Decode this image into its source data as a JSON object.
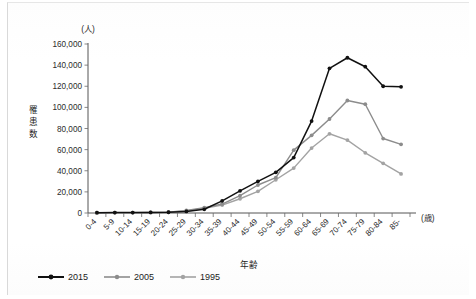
{
  "figure": {
    "y_unit_label": "(人)",
    "x_unit_label": "(歳)",
    "y_axis_title": "罹患数",
    "x_axis_title": "年齢"
  },
  "legend": {
    "items": [
      {
        "label": "2015",
        "color": "#111111"
      },
      {
        "label": "2005",
        "color": "#8c8c8c"
      },
      {
        "label": "1995",
        "color": "#a3a3a3"
      }
    ]
  },
  "chart_data": {
    "type": "line",
    "title": "",
    "xlabel": "年齢",
    "ylabel": "罹患数",
    "x_unit": "(歳)",
    "y_unit": "(人)",
    "grid": false,
    "legend_position": "bottom-left",
    "ylim": [
      0,
      160000
    ],
    "ytick_labels": [
      "160,000",
      "140,000",
      "120,000",
      "100,000",
      "80,000",
      "60,000",
      "40,000",
      "20,000",
      "0"
    ],
    "yticks": [
      160000,
      140000,
      120000,
      100000,
      80000,
      60000,
      40000,
      20000,
      0
    ],
    "categories": [
      "0-4",
      "5-9",
      "10-14",
      "15-19",
      "20-24",
      "25-29",
      "30-34",
      "35-39",
      "40-44",
      "45-49",
      "50-54",
      "55-59",
      "60-64",
      "65-69",
      "70-74",
      "75-79",
      "80-84",
      "85-"
    ],
    "series": [
      {
        "name": "2015",
        "color": "#111111",
        "values": [
          300,
          400,
          400,
          500,
          700,
          1500,
          3500,
          11500,
          21000,
          30000,
          38500,
          52500,
          87000,
          137000,
          147000,
          138500,
          120000,
          119500
        ]
      },
      {
        "name": "2005",
        "color": "#8c8c8c",
        "values": [
          300,
          400,
          400,
          500,
          800,
          2500,
          5000,
          8500,
          16500,
          26500,
          33500,
          59500,
          73500,
          89000,
          106500,
          103000,
          70500,
          65000
        ]
      },
      {
        "name": "1995",
        "color": "#a3a3a3",
        "values": [
          300,
          400,
          400,
          500,
          700,
          2000,
          4500,
          7500,
          13500,
          20500,
          31500,
          42500,
          61500,
          75000,
          69000,
          57000,
          47000,
          37000
        ]
      }
    ]
  }
}
